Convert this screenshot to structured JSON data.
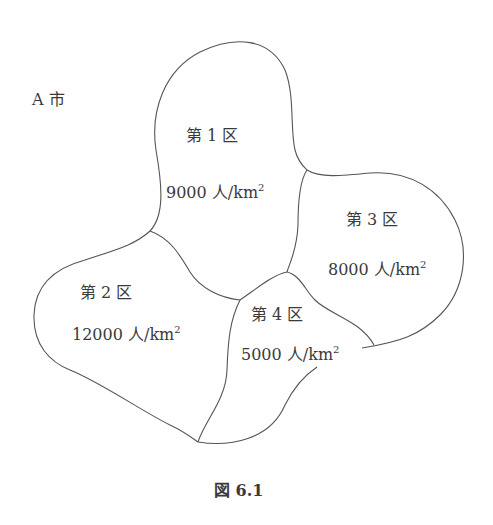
{
  "city_label": "A 市",
  "districts": [
    {
      "name": "第 1 区",
      "density_value": "9000 人/km",
      "density_exp": "2"
    },
    {
      "name": "第 2 区",
      "density_value": "12000 人/km",
      "density_exp": "2"
    },
    {
      "name": "第 3 区",
      "density_value": "8000 人/km",
      "density_exp": "2"
    },
    {
      "name": "第 4 区",
      "density_value": "5000 人/km",
      "density_exp": "2"
    }
  ],
  "caption": "図 6.1",
  "colors": {
    "stroke": "#555555",
    "text": "#3a3a3a",
    "background": "#ffffff"
  }
}
